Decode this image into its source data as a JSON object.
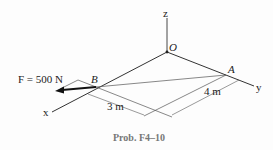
{
  "figure": {
    "caption": "Prob. F4–10",
    "axes": {
      "x": "x",
      "y": "y",
      "z": "z"
    },
    "points": {
      "O": "O",
      "A": "A",
      "B": "B"
    },
    "force_label": "F = 500 N",
    "dimensions": {
      "OB_dim": "3 m",
      "OA_dim": "4 m"
    },
    "colors": {
      "line": "#333333",
      "thin": "#555555",
      "caption": "#777777"
    }
  }
}
